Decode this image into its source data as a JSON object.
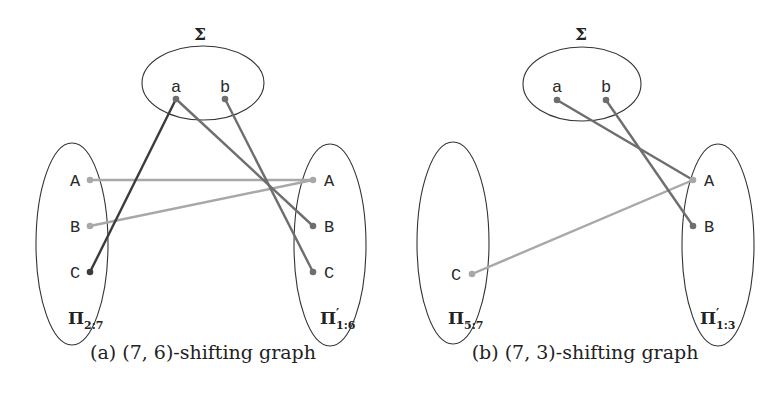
{
  "panels": [
    {
      "id": "a",
      "caption": "(a) (7, 6)-shifting graph",
      "sigma": {
        "label": "Σ",
        "nodes": [
          "a",
          "b"
        ]
      },
      "left_set": {
        "label": "Π",
        "subscript": "2:7",
        "prime": false,
        "nodes": [
          "A",
          "B",
          "C"
        ]
      },
      "right_set": {
        "label": "Π",
        "subscript": "1:6",
        "prime": true,
        "nodes": [
          "A",
          "B",
          "C"
        ]
      },
      "edges": [
        {
          "from": "Σ.a",
          "to": "Π2:7.C",
          "shade": "dark"
        },
        {
          "from": "Σ.a",
          "to": "Π'1:6.B",
          "shade": "medium"
        },
        {
          "from": "Σ.b",
          "to": "Π'1:6.C",
          "shade": "medium"
        },
        {
          "from": "Π2:7.A",
          "to": "Π'1:6.A",
          "shade": "light"
        },
        {
          "from": "Π2:7.B",
          "to": "Π'1:6.A",
          "shade": "light"
        }
      ]
    },
    {
      "id": "b",
      "caption": "(b) (7, 3)-shifting graph",
      "sigma": {
        "label": "Σ",
        "nodes": [
          "a",
          "b"
        ]
      },
      "left_set": {
        "label": "Π",
        "subscript": "5:7",
        "prime": false,
        "nodes": [
          "C"
        ]
      },
      "right_set": {
        "label": "Π",
        "subscript": "1:3",
        "prime": true,
        "nodes": [
          "A",
          "B"
        ]
      },
      "edges": [
        {
          "from": "Σ.a",
          "to": "Π'1:3.A",
          "shade": "medium"
        },
        {
          "from": "Σ.b",
          "to": "Π'1:3.B",
          "shade": "medium"
        },
        {
          "from": "Π5:7.C",
          "to": "Π'1:3.A",
          "shade": "light"
        }
      ]
    }
  ],
  "colors": {
    "dark": "#3c3c3c",
    "medium": "#6e6e6e",
    "light": "#a8a8a8",
    "outline": "#333333"
  },
  "text": {
    "a_caption": "(a) (7, 6)-shifting graph",
    "b_caption": "(b) (7, 3)-shifting graph",
    "sigma": "Σ",
    "pi": "Π",
    "prime": "′",
    "a_left_sub": "2:7",
    "a_right_sub": "1:6",
    "b_left_sub": "5:7",
    "b_right_sub": "1:3",
    "node_a": "a",
    "node_b": "b",
    "node_A": "A",
    "node_B": "B",
    "node_C": "C"
  }
}
